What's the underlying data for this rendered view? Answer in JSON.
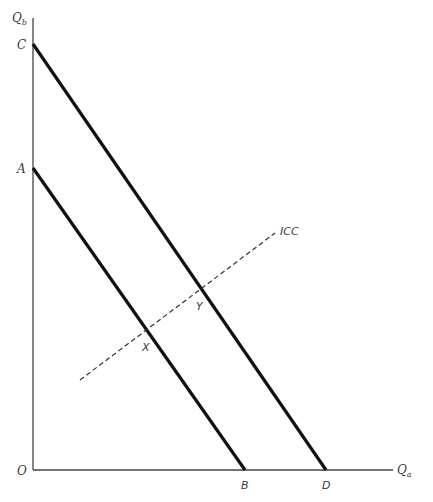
{
  "diagram": {
    "type": "economics-budget-lines-income-consumption-curve",
    "axes": {
      "y_label_main": "Q",
      "y_label_sub": "b",
      "x_label_main": "Q",
      "x_label_sub": "a",
      "origin_label": "O"
    },
    "lines": [
      {
        "name": "budget-line-AB",
        "from_label": "A",
        "to_label": "B",
        "style": "solid-thick"
      },
      {
        "name": "budget-line-CD",
        "from_label": "C",
        "to_label": "D",
        "style": "solid-thick"
      },
      {
        "name": "income-consumption-curve",
        "label": "ICC",
        "style": "dashed"
      }
    ],
    "points": {
      "A": "A",
      "B": "B",
      "C": "C",
      "D": "D",
      "X": "X",
      "Y": "Y"
    },
    "icc_label": "ICC",
    "colors": {
      "line": "#111111",
      "axis": "#444444",
      "text": "#3a3a3a"
    }
  }
}
